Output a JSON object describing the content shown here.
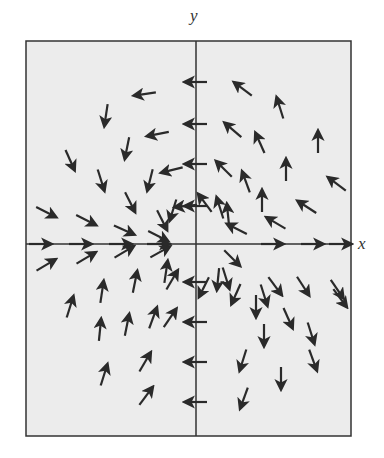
{
  "figure": {
    "type": "vector-field",
    "x_axis_label": "x",
    "y_axis_label": "y",
    "background": "#ececec",
    "arrow_color": "#2a2a2a",
    "frame": {
      "left": 26,
      "top": 41,
      "right": 351,
      "bottom": 436
    },
    "origin": {
      "x": 196,
      "y": 244
    }
  },
  "arrows": [
    [
      196,
      82,
      -1,
      0
    ],
    [
      196,
      124,
      -1,
      0
    ],
    [
      196,
      164,
      -1,
      0
    ],
    [
      196,
      206,
      -1,
      0
    ],
    [
      196,
      282,
      -1,
      0
    ],
    [
      196,
      322,
      -1,
      0
    ],
    [
      196,
      362,
      -1,
      0
    ],
    [
      196,
      402,
      -1,
      0
    ],
    [
      40,
      244,
      1,
      0
    ],
    [
      80,
      244,
      1,
      0
    ],
    [
      120,
      244,
      1,
      0
    ],
    [
      158,
      244,
      1,
      0
    ],
    [
      272,
      244,
      1,
      0
    ],
    [
      312,
      244,
      1,
      0
    ],
    [
      340,
      244,
      1,
      0
    ],
    [
      145,
      94,
      -1,
      0.15
    ],
    [
      158,
      134,
      -1,
      0.2
    ],
    [
      172,
      170,
      -1,
      0.25
    ],
    [
      186,
      206,
      -1,
      0.1
    ],
    [
      243,
      89,
      -0.8,
      -0.6
    ],
    [
      233,
      130,
      -0.75,
      -0.65
    ],
    [
      224,
      169,
      -0.7,
      -0.7
    ],
    [
      205,
      203,
      -0.6,
      -0.8
    ],
    [
      280,
      108,
      -0.3,
      -0.95
    ],
    [
      260,
      143,
      -0.4,
      -0.9
    ],
    [
      246,
      182,
      -0.35,
      -0.95
    ],
    [
      220,
      208,
      -0.3,
      -0.95
    ],
    [
      318,
      142,
      0,
      -1
    ],
    [
      286,
      170,
      0,
      -1
    ],
    [
      262,
      201,
      0,
      -1
    ],
    [
      228,
      215,
      -0.1,
      -1
    ],
    [
      337,
      184,
      -0.8,
      -0.6
    ],
    [
      307,
      207,
      -0.85,
      -0.55
    ],
    [
      276,
      223,
      -0.85,
      -0.5
    ],
    [
      237,
      229,
      -0.9,
      -0.45
    ],
    [
      106,
      115,
      -0.15,
      1
    ],
    [
      127,
      148,
      -0.2,
      1
    ],
    [
      150,
      180,
      -0.25,
      1
    ],
    [
      173,
      210,
      -0.3,
      0.95
    ],
    [
      70,
      160,
      0.4,
      0.9
    ],
    [
      101,
      180,
      0.3,
      0.95
    ],
    [
      130,
      202,
      0.45,
      0.9
    ],
    [
      162,
      220,
      0.45,
      0.9
    ],
    [
      46,
      212,
      0.9,
      0.45
    ],
    [
      86,
      220,
      0.9,
      0.45
    ],
    [
      124,
      230,
      0.9,
      0.4
    ],
    [
      158,
      236,
      0.9,
      0.45
    ],
    [
      46,
      265,
      0.85,
      -0.5
    ],
    [
      86,
      258,
      0.85,
      -0.5
    ],
    [
      124,
      252,
      0.85,
      -0.5
    ],
    [
      160,
      252,
      0.9,
      -0.5
    ],
    [
      70,
      307,
      0.3,
      -0.95
    ],
    [
      102,
      292,
      0.15,
      -1
    ],
    [
      135,
      282,
      0.2,
      -1
    ],
    [
      166,
      272,
      0.15,
      -1
    ],
    [
      100,
      330,
      0.1,
      -1
    ],
    [
      127,
      325,
      0.2,
      -1
    ],
    [
      153,
      318,
      0.35,
      -0.95
    ],
    [
      172,
      280,
      0.5,
      -0.85
    ],
    [
      104,
      375,
      0.3,
      -0.95
    ],
    [
      145,
      362,
      0.5,
      -0.85
    ],
    [
      170,
      318,
      0.55,
      -0.8
    ],
    [
      146,
      396,
      0.6,
      -0.8
    ],
    [
      236,
      294,
      -0.4,
      0.9
    ],
    [
      243,
      360,
      -0.3,
      0.95
    ],
    [
      244,
      398,
      -0.35,
      0.95
    ],
    [
      204,
      287,
      -0.45,
      0.9
    ],
    [
      218,
      279,
      -0.1,
      1
    ],
    [
      226,
      278,
      0.3,
      0.95
    ],
    [
      232,
      258,
      0.7,
      0.7
    ],
    [
      256,
      306,
      0,
      1
    ],
    [
      264,
      295,
      0.3,
      0.95
    ],
    [
      275,
      286,
      0.6,
      0.8
    ],
    [
      264,
      335,
      0,
      1
    ],
    [
      288,
      318,
      0.4,
      0.9
    ],
    [
      303,
      286,
      0.55,
      0.85
    ],
    [
      281,
      378,
      0,
      1
    ],
    [
      311,
      333,
      0.3,
      0.95
    ],
    [
      340,
      298,
      0.6,
      0.8
    ],
    [
      313,
      360,
      0.35,
      0.95
    ],
    [
      337,
      289,
      0.55,
      0.8
    ]
  ]
}
